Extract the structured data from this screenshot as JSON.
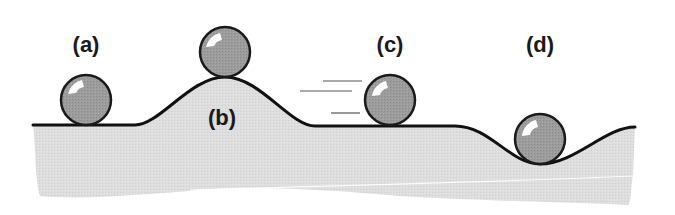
{
  "diagram": {
    "type": "equilibrium-states",
    "colors": {
      "ground_fill": "#dcdcdc",
      "ground_line": "#111111",
      "ball_fill": "#9a9a9a",
      "ball_stroke": "#1a1a1a",
      "highlight": "#ffffff",
      "motion_lines": "#555555"
    },
    "labels": [
      {
        "id": "a",
        "text": "(a)",
        "x": 86,
        "y": 45
      },
      {
        "id": "b",
        "text": "(b)",
        "x": 222,
        "y": 118
      },
      {
        "id": "c",
        "text": "(c)",
        "x": 390,
        "y": 45
      },
      {
        "id": "d",
        "text": "(d)",
        "x": 540,
        "y": 45
      }
    ],
    "balls": [
      {
        "id": "a",
        "cx": 86,
        "cy": 100,
        "r": 25,
        "position": "flat surface"
      },
      {
        "id": "b",
        "cx": 225,
        "cy": 52,
        "r": 25,
        "position": "top of hill"
      },
      {
        "id": "c",
        "cx": 390,
        "cy": 100,
        "r": 25,
        "position": "flat surface, moving"
      },
      {
        "id": "d",
        "cx": 540,
        "cy": 139,
        "r": 25,
        "position": "bottom of valley"
      }
    ],
    "motion_lines": [
      {
        "x1": 323,
        "x2": 362,
        "y": 81
      },
      {
        "x1": 300,
        "x2": 352,
        "y": 91
      },
      {
        "x1": 331,
        "x2": 360,
        "y": 113
      }
    ]
  }
}
